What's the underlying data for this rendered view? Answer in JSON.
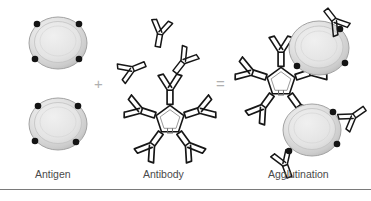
{
  "figure": {
    "background_color": "#ffffff",
    "width": 371,
    "height": 201,
    "operators": {
      "plus": "+",
      "equals": "="
    },
    "captions": [
      {
        "id": "antigen",
        "label": "Antigen"
      },
      {
        "id": "antibody",
        "label": "Antibody"
      },
      {
        "id": "agglutination",
        "label": "Agglutination"
      }
    ],
    "colors": {
      "cell_fill_light": "#e8e8e8",
      "cell_fill_mid": "#d2d2d2",
      "cell_fill_dark": "#b8b8b8",
      "cell_outline": "#9a9a9a",
      "epitope_dot": "#1a1a1a",
      "antibody_stroke": "#1a1a1a",
      "antibody_fill": "#ffffff",
      "operator": "#b0b0b0",
      "caption_text": "#4a4a4a",
      "rule": "#7a7a7a"
    },
    "panels": {
      "antigen": {
        "name": "Antigen panel",
        "cells": [
          {
            "cx": 58,
            "cy": 43,
            "rx": 29,
            "ry": 26,
            "epitopes": 4
          },
          {
            "cx": 58,
            "cy": 124,
            "rx": 29,
            "ry": 26,
            "epitopes": 4
          }
        ]
      },
      "antibody": {
        "name": "Antibody panel",
        "free_antibodies": [
          {
            "cx": 160,
            "cy": 33,
            "rot": 8
          },
          {
            "cx": 133,
            "cy": 68,
            "rot": -105
          },
          {
            "cx": 182,
            "cy": 62,
            "rot": 35
          }
        ],
        "pentamer": {
          "cx": 170,
          "cy": 120,
          "arms": 5,
          "label": "IgM pentamer"
        }
      },
      "agglutination": {
        "name": "Agglutination panel",
        "cells": [
          {
            "cx": 319,
            "cy": 48,
            "rx": 30,
            "ry": 27,
            "epitopes": 3
          },
          {
            "cx": 312,
            "cy": 130,
            "rx": 29,
            "ry": 26,
            "epitopes": 3
          }
        ],
        "pentamer": {
          "cx": 281,
          "cy": 82,
          "arms": 5
        },
        "free_antibodies": [
          {
            "cx": 307,
            "cy": 14,
            "rot": 30
          },
          {
            "cx": 352,
            "cy": 110,
            "rot": 60
          },
          {
            "cx": 291,
            "cy": 170,
            "rot": 25
          }
        ]
      }
    }
  }
}
